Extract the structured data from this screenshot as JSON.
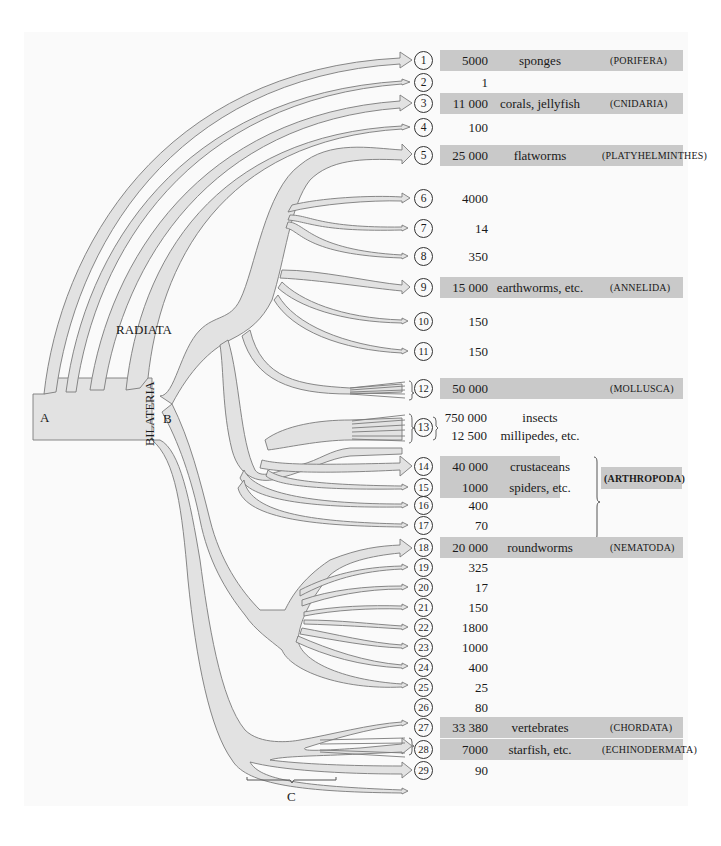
{
  "figure": {
    "node_labels": {
      "A": "A",
      "B": "B",
      "C": "C"
    },
    "group_labels": {
      "radiata": "RADIATA",
      "bilateria": "BILATERIA"
    },
    "arthropoda_label": "(ARTHROPODA)",
    "rows": [
      {
        "n": "1",
        "species": "5000",
        "common": "sponges",
        "phylum": "(PORIFERA)",
        "shaded": true
      },
      {
        "n": "2",
        "species": "1",
        "common": "",
        "phylum": "",
        "shaded": false
      },
      {
        "n": "3",
        "species": "11 000",
        "common": "corals, jellyfish",
        "phylum": "(CNIDARIA)",
        "shaded": true
      },
      {
        "n": "4",
        "species": "100",
        "common": "",
        "phylum": "",
        "shaded": false
      },
      {
        "n": "5",
        "species": "25 000",
        "common": "flatworms",
        "phylum": "(PLATYHELMINTHES)",
        "shaded": true
      },
      {
        "n": "6",
        "species": "4000",
        "common": "",
        "phylum": "",
        "shaded": false
      },
      {
        "n": "7",
        "species": "14",
        "common": "",
        "phylum": "",
        "shaded": false
      },
      {
        "n": "8",
        "species": "350",
        "common": "",
        "phylum": "",
        "shaded": false
      },
      {
        "n": "9",
        "species": "15 000",
        "common": "earthworms, etc.",
        "phylum": "(ANNELIDA)",
        "shaded": true
      },
      {
        "n": "10",
        "species": "150",
        "common": "",
        "phylum": "",
        "shaded": false
      },
      {
        "n": "11",
        "species": "150",
        "common": "",
        "phylum": "",
        "shaded": false
      },
      {
        "n": "12",
        "species": "50 000",
        "common": "",
        "phylum": "(MOLLUSCA)",
        "shaded": true
      },
      {
        "n": "13",
        "species": "750 000",
        "common": "insects",
        "phylum": "",
        "shaded": false,
        "species2": "12 500",
        "common2": "millipedes, etc."
      },
      {
        "n": "14",
        "species": "40 000",
        "common": "crustaceans",
        "phylum": "",
        "shaded": true
      },
      {
        "n": "15",
        "species": "1000",
        "common": "spiders, etc.",
        "phylum": "",
        "shaded": true
      },
      {
        "n": "16",
        "species": "400",
        "common": "",
        "phylum": "",
        "shaded": false
      },
      {
        "n": "17",
        "species": "70",
        "common": "",
        "phylum": "",
        "shaded": false
      },
      {
        "n": "18",
        "species": "20 000",
        "common": "roundworms",
        "phylum": "(NEMATODA)",
        "shaded": true
      },
      {
        "n": "19",
        "species": "325",
        "common": "",
        "phylum": "",
        "shaded": false
      },
      {
        "n": "20",
        "species": "17",
        "common": "",
        "phylum": "",
        "shaded": false
      },
      {
        "n": "21",
        "species": "150",
        "common": "",
        "phylum": "",
        "shaded": false
      },
      {
        "n": "22",
        "species": "1800",
        "common": "",
        "phylum": "",
        "shaded": false
      },
      {
        "n": "23",
        "species": "1000",
        "common": "",
        "phylum": "",
        "shaded": false
      },
      {
        "n": "24",
        "species": "400",
        "common": "",
        "phylum": "",
        "shaded": false
      },
      {
        "n": "25",
        "species": "25",
        "common": "",
        "phylum": "",
        "shaded": false
      },
      {
        "n": "26",
        "species": "80",
        "common": "",
        "phylum": "",
        "shaded": false
      },
      {
        "n": "27",
        "species": "33 380",
        "common": "vertebrates",
        "phylum": "(CHORDATA)",
        "shaded": true
      },
      {
        "n": "28",
        "species": "7000",
        "common": "starfish, etc.",
        "phylum": "(ECHINODERMATA)",
        "shaded": true
      },
      {
        "n": "29",
        "species": "90",
        "common": "",
        "phylum": "",
        "shaded": false
      }
    ],
    "colors": {
      "branch_fill": "#e2e2e2",
      "branch_stroke": "#7a7a7a",
      "box_fill": "#c9c9c9",
      "panel": "#fafafa"
    }
  }
}
